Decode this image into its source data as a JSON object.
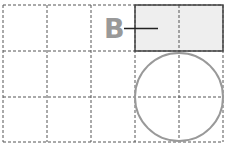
{
  "diagram": {
    "grid": {
      "columns": 5,
      "rows": 3,
      "line_color": "#555555",
      "dash": "3,2"
    },
    "rectangle": {
      "fill": "#eeeeee",
      "stroke": "#444444",
      "col_start": 3,
      "col_end": 5,
      "row": 0
    },
    "circle": {
      "stroke": "#999999",
      "col_center": 4,
      "row_center": 2
    },
    "label": {
      "text": "B",
      "color": "#999999",
      "leader_color": "#222222"
    }
  }
}
